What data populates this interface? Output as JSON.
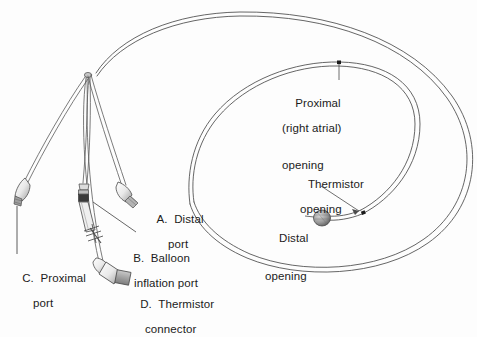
{
  "diagram": {
    "background_color": "#fdfdfd",
    "line_color": "#4a4a4a",
    "text_color": "#1b1b1b"
  },
  "port_labels": [
    {
      "id": "distal-port",
      "letter": "A.",
      "line1": "A.  Distal",
      "line2": "port",
      "x": 144,
      "y": 200
    },
    {
      "id": "balloon-inflation-port",
      "letter": "B.",
      "line1": "B.  Balloon",
      "line2": "inflation port",
      "x": 120,
      "y": 239
    },
    {
      "id": "proximal-port",
      "letter": "C.",
      "line1": "C.  Proximal",
      "line2": "port",
      "x": 9,
      "y": 259
    },
    {
      "id": "thermistor-connector",
      "letter": "D.",
      "line1": "D.  Thermistor",
      "line2": "connector",
      "x": 127,
      "y": 285
    }
  ],
  "opening_labels": [
    {
      "id": "proximal-opening",
      "line1": "Proximal",
      "line2": "(right atrial)",
      "line3": "opening",
      "x": 282,
      "y": 84
    },
    {
      "id": "thermistor-opening",
      "line1": "Thermistor",
      "line2": "opening",
      "x": 295,
      "y": 165
    },
    {
      "id": "distal-opening",
      "line1": "Distal",
      "line2": "opening",
      "x": 265,
      "y": 207
    }
  ]
}
